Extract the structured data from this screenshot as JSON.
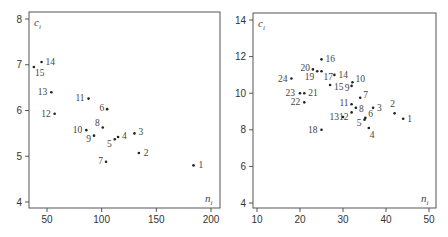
{
  "chart_data": [
    {
      "type": "scatter",
      "title": "",
      "xlabel": "n_i",
      "ylabel": "c_i",
      "xlim": [
        33,
        204
      ],
      "ylim": [
        3.85,
        8.15
      ],
      "xticks": [
        50,
        100,
        150,
        200
      ],
      "yticks": [
        4,
        5,
        6,
        7,
        8
      ],
      "grid": false,
      "legend": null,
      "points": [
        {
          "label": "1",
          "x": 184,
          "y": 4.8
        },
        {
          "label": "2",
          "x": 134,
          "y": 5.07
        },
        {
          "label": "3",
          "x": 130,
          "y": 5.5
        },
        {
          "label": "4",
          "x": 115,
          "y": 5.42
        },
        {
          "label": "5",
          "x": 112,
          "y": 5.37
        },
        {
          "label": "6",
          "x": 105,
          "y": 6.03
        },
        {
          "label": "7",
          "x": 104,
          "y": 4.88
        },
        {
          "label": "8",
          "x": 101,
          "y": 5.63
        },
        {
          "label": "9",
          "x": 93,
          "y": 5.45
        },
        {
          "label": "10",
          "x": 86,
          "y": 5.57
        },
        {
          "label": "11",
          "x": 88,
          "y": 6.26
        },
        {
          "label": "12",
          "x": 57,
          "y": 5.93
        },
        {
          "label": "13",
          "x": 54,
          "y": 6.4
        },
        {
          "label": "14",
          "x": 45,
          "y": 7.06
        },
        {
          "label": "15",
          "x": 38,
          "y": 6.95
        }
      ]
    },
    {
      "type": "scatter",
      "title": "",
      "xlabel": "n_i",
      "ylabel": "c_i",
      "xlim": [
        9,
        51
      ],
      "ylim": [
        3.6,
        14.3
      ],
      "xticks": [
        10,
        20,
        30,
        40,
        50
      ],
      "yticks": [
        4,
        6,
        8,
        10,
        12,
        14
      ],
      "grid": false,
      "legend": null,
      "points": [
        {
          "label": "1",
          "x": 44,
          "y": 8.6
        },
        {
          "label": "2",
          "x": 42,
          "y": 8.9
        },
        {
          "label": "3",
          "x": 37,
          "y": 9.2
        },
        {
          "label": "4",
          "x": 36,
          "y": 8.1
        },
        {
          "label": "5",
          "x": 35,
          "y": 8.55
        },
        {
          "label": "6",
          "x": 35.2,
          "y": 8.65
        },
        {
          "label": "7",
          "x": 34,
          "y": 9.75
        },
        {
          "label": "8",
          "x": 33,
          "y": 9.2
        },
        {
          "label": "9",
          "x": 32,
          "y": 10.4
        },
        {
          "label": "10",
          "x": 32.2,
          "y": 10.6
        },
        {
          "label": "11",
          "x": 32,
          "y": 9.4
        },
        {
          "label": "12",
          "x": 32,
          "y": 8.95
        },
        {
          "label": "13",
          "x": 30,
          "y": 8.7
        },
        {
          "label": "14",
          "x": 28,
          "y": 11.0
        },
        {
          "label": "15",
          "x": 27,
          "y": 10.45
        },
        {
          "label": "16",
          "x": 25,
          "y": 11.85
        },
        {
          "label": "17",
          "x": 25,
          "y": 11.2
        },
        {
          "label": "18",
          "x": 25,
          "y": 8.0
        },
        {
          "label": "19",
          "x": 24,
          "y": 11.2
        },
        {
          "label": "20",
          "x": 23,
          "y": 11.3
        },
        {
          "label": "21",
          "x": 21,
          "y": 10.0
        },
        {
          "label": "22",
          "x": 21,
          "y": 9.5
        },
        {
          "label": "23",
          "x": 20,
          "y": 10.0
        },
        {
          "label": "24",
          "x": 18,
          "y": 10.8
        }
      ]
    }
  ]
}
